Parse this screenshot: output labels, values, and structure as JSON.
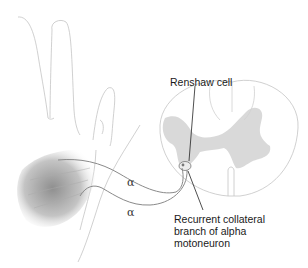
{
  "figure": {
    "type": "anatomical-illustration",
    "labels": {
      "renshaw_cell": "Renshaw cell",
      "collateral_line1": "Recurrent collateral",
      "collateral_line2": "branch of alpha",
      "collateral_line3": "motoneuron",
      "alpha_upper": "α",
      "alpha_lower": "α"
    },
    "colors": {
      "outline": "#bdbdbd",
      "grey_matter": "#d9d9d9",
      "muscle": "#9a9a9a",
      "nerve": "#8a8a8a",
      "leader_line": "#222222"
    }
  }
}
